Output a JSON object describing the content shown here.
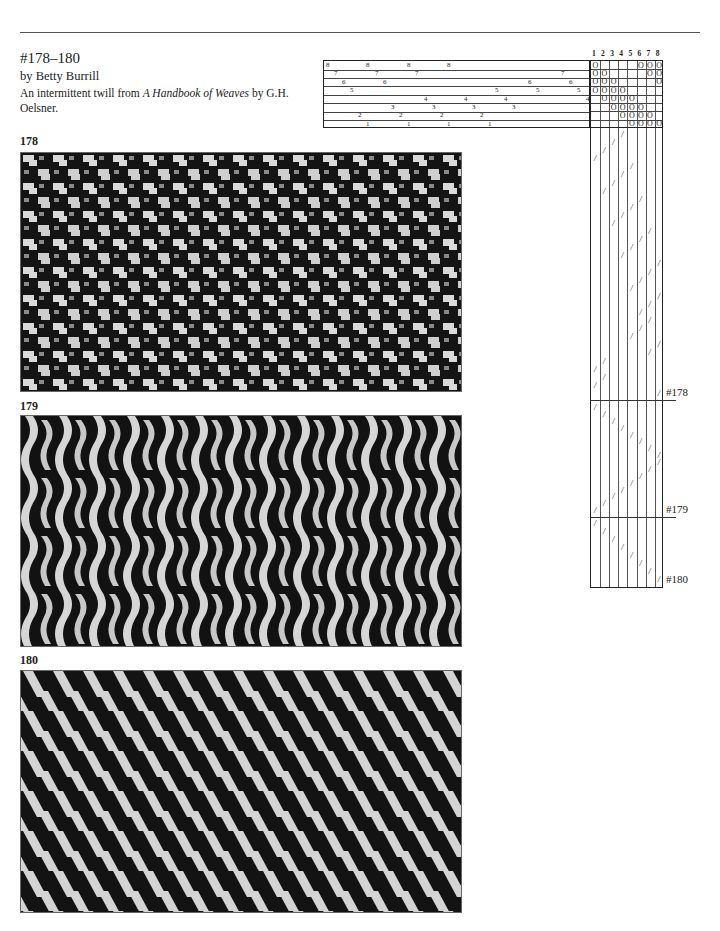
{
  "header": {
    "title": "#178–180",
    "byline": "by Betty Burrill",
    "description_pre": "An intermittent twill from ",
    "description_book": "A Handbook of Weaves",
    "description_post": " by G.H. Oelsner."
  },
  "swatches": [
    {
      "label": "178",
      "pattern": "broken-checker"
    },
    {
      "label": "179",
      "pattern": "wave-chevron"
    },
    {
      "label": "180",
      "pattern": "diagonal-twill"
    }
  ],
  "draft": {
    "threading": {
      "shaft_rows_top_to_bottom": [
        8,
        7,
        6,
        5,
        4,
        3,
        2,
        1
      ],
      "entries": [
        {
          "shaft": 8,
          "x": [
            2,
            42,
            83,
            123
          ]
        },
        {
          "shaft": 7,
          "x": [
            10,
            51,
            91,
            237
          ]
        },
        {
          "shaft": 6,
          "x": [
            18,
            59,
            204,
            245
          ]
        },
        {
          "shaft": 5,
          "x": [
            26,
            171,
            212,
            253
          ]
        },
        {
          "shaft": 4,
          "x": [
            100,
            140,
            180,
            262
          ]
        },
        {
          "shaft": 3,
          "x": [
            67,
            108,
            148,
            188
          ]
        },
        {
          "shaft": 2,
          "x": [
            34,
            75,
            116,
            156
          ]
        },
        {
          "shaft": 1,
          "x": [
            42,
            83,
            123,
            164
          ]
        }
      ]
    },
    "tieup": {
      "treadle_numbers": [
        "1",
        "2",
        "3",
        "4",
        "5",
        "6",
        "7",
        "8"
      ],
      "symbol": "O",
      "rows_top_to_bottom": [
        [
          1,
          6,
          7,
          8
        ],
        [
          1,
          2,
          7,
          8
        ],
        [
          1,
          2,
          3,
          8
        ],
        [
          1,
          2,
          3,
          4
        ],
        [
          2,
          3,
          4,
          5
        ],
        [
          3,
          4,
          5,
          6
        ],
        [
          4,
          5,
          6,
          7
        ],
        [
          5,
          6,
          7,
          8
        ]
      ]
    },
    "treadling": {
      "symbol": "/",
      "sections": [
        {
          "label": "#178",
          "end_y": 400
        },
        {
          "label": "#179",
          "end_y": 517
        },
        {
          "label": "#180",
          "end_y": 587
        }
      ]
    }
  }
}
